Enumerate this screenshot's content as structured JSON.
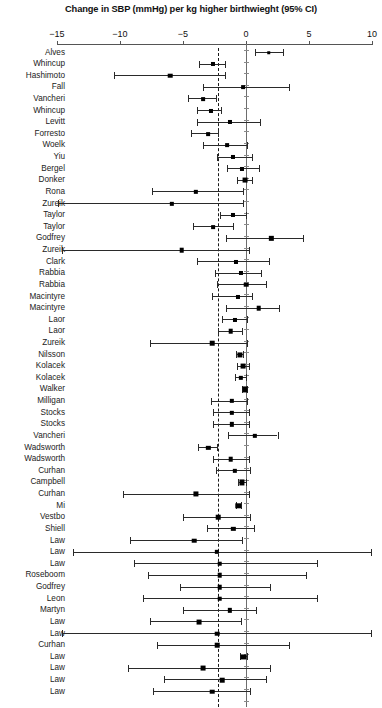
{
  "chart_data": {
    "type": "scatter",
    "plot_kind": "forest-plot",
    "title": "Change in SBP (mmHg) per kg higher birthwieght (95% CI)",
    "xlabel": "",
    "ylabel": "",
    "xlim": [
      -15,
      10
    ],
    "xticks": [
      -15,
      -10,
      -5,
      0,
      5,
      10
    ],
    "xtick_labels": [
      "−15",
      "−10",
      "−5",
      "0",
      "5",
      "10"
    ],
    "grid": false,
    "legend": null,
    "reference_lines": [
      {
        "name": "null-effect-line",
        "x": 0,
        "style": "solid",
        "color": "#6d6d6d"
      },
      {
        "name": "pooled-estimate-line",
        "x": -2.2,
        "style": "dashed",
        "color": "#1a1a1a"
      }
    ],
    "categories": [
      "Alves",
      "Whincup",
      "Hashimoto",
      "Fall",
      "Vancheri",
      "Whincup",
      "Levitt",
      "Forresto",
      "Woelk",
      "Yiu",
      "Bergel",
      "Donker",
      "Rona",
      "Zureik",
      "Taylor",
      "Taylor",
      "Godfrey",
      "Zureik",
      "Clark",
      "Rabbia",
      "Rabbia",
      "Macintyre",
      "Macintyre",
      "Laor",
      "Laor",
      "Zureik",
      "Nilsson",
      "Kolacek",
      "Kolacek",
      "Walker",
      "Milligan",
      "Stocks",
      "Stocks",
      "Vancheri",
      "Wadsworth",
      "Wadsworth",
      "Curhan",
      "Campbell",
      "Curhan",
      "Mi",
      "Vestbo",
      "Shiell",
      "Law",
      "Law",
      "Law",
      "Roseboom",
      "Godfrey",
      "Leon",
      "Martyn",
      "Law",
      "Law",
      "Curhan",
      "Law",
      "Law",
      "Law",
      "Law"
    ],
    "studies": [
      {
        "label": "Alves",
        "estimate": 1.8,
        "lower": 0.7,
        "upper": 2.9,
        "weight": 2.6
      },
      {
        "label": "Whincup",
        "estimate": -2.6,
        "lower": -3.7,
        "upper": -1.7,
        "weight": 3.0
      },
      {
        "label": "Hashimoto",
        "estimate": -6.0,
        "lower": -10.5,
        "upper": -1.7,
        "weight": 3.4
      },
      {
        "label": "Fall",
        "estimate": -0.2,
        "lower": -3.4,
        "upper": 3.4,
        "weight": 2.8
      },
      {
        "label": "Vancheri",
        "estimate": -3.4,
        "lower": -4.6,
        "upper": -2.4,
        "weight": 2.8
      },
      {
        "label": "Whincup",
        "estimate": -2.8,
        "lower": -3.9,
        "upper": -2.0,
        "weight": 3.0
      },
      {
        "label": "Levitt",
        "estimate": -1.3,
        "lower": -3.9,
        "upper": 1.1,
        "weight": 3.0
      },
      {
        "label": "Forresto",
        "estimate": -3.0,
        "lower": -4.4,
        "upper": -2.2,
        "weight": 2.8
      },
      {
        "label": "Woelk",
        "estimate": -1.5,
        "lower": -3.4,
        "upper": 0.1,
        "weight": 2.8
      },
      {
        "label": "Yiu",
        "estimate": -1.0,
        "lower": -2.3,
        "upper": 0.5,
        "weight": 3.0
      },
      {
        "label": "Bergel",
        "estimate": -0.3,
        "lower": -1.5,
        "upper": 1.0,
        "weight": 3.0
      },
      {
        "label": "Donker",
        "estimate": -0.1,
        "lower": -0.7,
        "upper": 0.5,
        "weight": 3.6
      },
      {
        "label": "Rona",
        "estimate": -4.0,
        "lower": -7.5,
        "upper": -0.2,
        "weight": 3.2
      },
      {
        "label": "Zureik",
        "estimate": -5.9,
        "lower": -14.9,
        "upper": -0.2,
        "weight": 3.2
      },
      {
        "label": "Taylor",
        "estimate": -1.0,
        "lower": -2.1,
        "upper": 0.0,
        "weight": 3.0
      },
      {
        "label": "Taylor",
        "estimate": -2.6,
        "lower": -4.2,
        "upper": -1.0,
        "weight": 2.8
      },
      {
        "label": "Godfrey",
        "estimate": 2.0,
        "lower": -1.6,
        "upper": 4.5,
        "weight": 3.2
      },
      {
        "label": "Zureik",
        "estimate": -5.1,
        "lower": -14.6,
        "upper": 0.2,
        "weight": 3.4
      },
      {
        "label": "Clark",
        "estimate": -0.8,
        "lower": -3.9,
        "upper": 1.8,
        "weight": 3.0
      },
      {
        "label": "Rabbia",
        "estimate": -0.4,
        "lower": -2.5,
        "upper": 1.2,
        "weight": 3.0
      },
      {
        "label": "Rabbia",
        "estimate": 0.0,
        "lower": -2.3,
        "upper": 1.6,
        "weight": 3.4
      },
      {
        "label": "Macintyre",
        "estimate": -0.6,
        "lower": -2.7,
        "upper": 0.5,
        "weight": 3.0
      },
      {
        "label": "Macintyre",
        "estimate": 1.0,
        "lower": -1.6,
        "upper": 2.6,
        "weight": 3.4
      },
      {
        "label": "Laor",
        "estimate": -0.9,
        "lower": -1.9,
        "upper": 0.1,
        "weight": 3.0
      },
      {
        "label": "Laor",
        "estimate": -1.2,
        "lower": -2.2,
        "upper": -0.3,
        "weight": 3.4
      },
      {
        "label": "Zureik",
        "estimate": -2.7,
        "lower": -7.6,
        "upper": 0.1,
        "weight": 3.4
      },
      {
        "label": "Nilsson",
        "estimate": -0.5,
        "lower": -0.8,
        "upper": -0.2,
        "weight": 3.8
      },
      {
        "label": "Kolacek",
        "estimate": -0.2,
        "lower": -0.7,
        "upper": 0.2,
        "weight": 3.6
      },
      {
        "label": "Kolacek",
        "estimate": -0.4,
        "lower": -0.9,
        "upper": 0.0,
        "weight": 3.2
      },
      {
        "label": "Walker",
        "estimate": -0.1,
        "lower": -0.3,
        "upper": 0.1,
        "weight": 3.8
      },
      {
        "label": "Milligan",
        "estimate": -1.1,
        "lower": -2.8,
        "upper": 0.1,
        "weight": 3.2
      },
      {
        "label": "Stocks",
        "estimate": -1.1,
        "lower": -2.6,
        "upper": 0.2,
        "weight": 3.2
      },
      {
        "label": "Stocks",
        "estimate": -1.1,
        "lower": -2.6,
        "upper": 0.2,
        "weight": 3.2
      },
      {
        "label": "Vancheri",
        "estimate": 0.7,
        "lower": -1.4,
        "upper": 2.5,
        "weight": 3.2
      },
      {
        "label": "Wadsworth",
        "estimate": -3.0,
        "lower": -3.8,
        "upper": -2.3,
        "weight": 3.2
      },
      {
        "label": "Wadsworth",
        "estimate": -1.2,
        "lower": -2.6,
        "upper": 0.2,
        "weight": 3.4
      },
      {
        "label": "Curhan",
        "estimate": -0.9,
        "lower": -2.4,
        "upper": 0.3,
        "weight": 3.2
      },
      {
        "label": "Campbell",
        "estimate": -0.3,
        "lower": -0.6,
        "upper": 0.0,
        "weight": 3.8
      },
      {
        "label": "Curhan",
        "estimate": -4.0,
        "lower": -9.8,
        "upper": 0.2,
        "weight": 3.8
      },
      {
        "label": "Mi",
        "estimate": -0.6,
        "lower": -0.8,
        "upper": -0.4,
        "weight": 4.0
      },
      {
        "label": "Vestbo",
        "estimate": -2.2,
        "lower": -5.0,
        "upper": 0.3,
        "weight": 3.4
      },
      {
        "label": "Shiell",
        "estimate": -1.0,
        "lower": -3.1,
        "upper": 0.6,
        "weight": 3.2
      },
      {
        "label": "Law",
        "estimate": -4.1,
        "lower": -9.2,
        "upper": -0.3,
        "weight": 3.4
      },
      {
        "label": "Law",
        "estimate": -2.3,
        "lower": -13.7,
        "upper": 9.9,
        "weight": 3.2
      },
      {
        "label": "Law",
        "estimate": -2.1,
        "lower": -8.9,
        "upper": 5.6,
        "weight": 3.4
      },
      {
        "label": "Roseboom",
        "estimate": -2.1,
        "lower": -7.8,
        "upper": 4.8,
        "weight": 3.4
      },
      {
        "label": "Godfrey",
        "estimate": -2.1,
        "lower": -5.2,
        "upper": 1.9,
        "weight": 3.4
      },
      {
        "label": "Leon",
        "estimate": -2.1,
        "lower": -8.2,
        "upper": 5.6,
        "weight": 3.4
      },
      {
        "label": "Martyn",
        "estimate": -1.3,
        "lower": -5.0,
        "upper": 0.8,
        "weight": 3.2
      },
      {
        "label": "Law",
        "estimate": -3.7,
        "lower": -7.6,
        "upper": -0.4,
        "weight": 3.6
      },
      {
        "label": "Law",
        "estimate": -2.3,
        "lower": -14.6,
        "upper": 9.9,
        "weight": 3.4
      },
      {
        "label": "Curhan",
        "estimate": -2.3,
        "lower": -7.1,
        "upper": 3.4,
        "weight": 3.4
      },
      {
        "label": "Law",
        "estimate": -0.2,
        "lower": -0.5,
        "upper": 0.1,
        "weight": 3.8
      },
      {
        "label": "Law",
        "estimate": -3.4,
        "lower": -9.4,
        "upper": 1.9,
        "weight": 3.6
      },
      {
        "label": "Law",
        "estimate": -1.9,
        "lower": -6.5,
        "upper": 1.6,
        "weight": 3.4
      },
      {
        "label": "Law",
        "estimate": -2.7,
        "lower": -7.4,
        "upper": 0.3,
        "weight": 3.4
      }
    ]
  },
  "colors": {
    "marker": "#000000",
    "ci": "#2a2a2a",
    "axis": "#555555",
    "zero_line": "#6d6d6d",
    "dashed_line": "#1a1a1a",
    "background": "#ffffff"
  }
}
